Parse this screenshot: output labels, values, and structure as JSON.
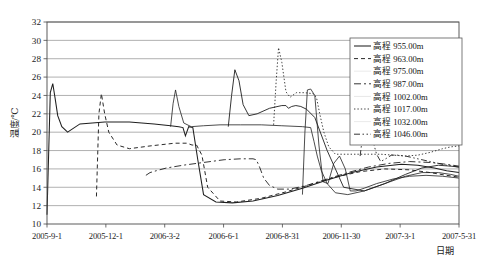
{
  "chart_data": {
    "type": "line",
    "title": "",
    "xlabel": "日期",
    "ylabel": "温度/℃",
    "ylim": [
      10,
      32
    ],
    "ytick_step": 2,
    "yticks": [
      "32",
      "30",
      "28",
      "26",
      "24",
      "22",
      "20",
      "18",
      "16",
      "14",
      "12",
      "10"
    ],
    "xticks": [
      "2005-9-1",
      "2005-12-1",
      "2006-3-2",
      "2006-6-1",
      "2006-8-31",
      "2006-11-30",
      "2007-3-1",
      "2007-5-31"
    ],
    "xlim_labels": [
      "2005-9-1",
      "2007-5-31"
    ],
    "grid": "horizontal",
    "legend_position": "top-right-inside",
    "legend_title": "",
    "line_color": "#1f1f1f",
    "series": [
      {
        "name": "高程 955.00m",
        "label": "高程 955.00m",
        "style": "solid",
        "dash": "none",
        "x": [
          0,
          0.8,
          1.4,
          2.0,
          2.6,
          3.6,
          5.0,
          8.0,
          14.0,
          20.0,
          26.0,
          30.0,
          32.0,
          33.0,
          33.6,
          34.4,
          35.4,
          36.6,
          38.0,
          41.0,
          45.0,
          50.0,
          56.0,
          62.0,
          68.0,
          74.0,
          80.0,
          86.0,
          90.0,
          94.0,
          97.0,
          100.0
        ],
        "y": [
          11.0,
          24.3,
          25.3,
          23.6,
          21.8,
          20.6,
          20.0,
          20.9,
          21.1,
          21.1,
          20.9,
          20.7,
          20.6,
          20.5,
          19.6,
          20.6,
          20.5,
          17.0,
          13.2,
          12.4,
          12.3,
          12.5,
          13.1,
          13.9,
          14.8,
          15.6,
          16.2,
          16.5,
          16.4,
          16.1,
          15.8,
          15.6
        ]
      },
      {
        "name": "高程 963.00m",
        "label": "高程 963.00m",
        "style": "dashed",
        "dash": "4,3",
        "x": [
          12.0,
          12.6,
          13.2,
          14.0,
          15.0,
          17.0,
          20.0,
          25.0,
          31.0,
          34.0,
          35.2,
          36.3,
          37.6,
          39.0,
          42.0,
          46.0,
          52.0,
          58.0,
          64.0,
          70.0,
          76.0,
          82.0,
          88.0,
          93.0,
          97.0,
          100.0
        ],
        "y": [
          13.0,
          22.0,
          24.2,
          22.0,
          20.0,
          18.6,
          18.2,
          18.5,
          18.8,
          18.8,
          18.6,
          18.6,
          17.5,
          14.0,
          12.5,
          12.4,
          12.8,
          13.5,
          14.3,
          15.1,
          15.7,
          16.0,
          15.9,
          15.6,
          15.3,
          15.1
        ]
      },
      {
        "name": "高程 975.00m",
        "label": "高程 975.00m",
        "style": "solid-thin",
        "dash": "none",
        "x": [
          30.0,
          30.6,
          31.2,
          32.0,
          33.2,
          35.0,
          38.0,
          42.0,
          47.0,
          52.0,
          57.0,
          62.0,
          64.0,
          64.8,
          65.6,
          66.6,
          68.0,
          70.0,
          73.0,
          77.0,
          82.0,
          87.0,
          91.0,
          95.0,
          98.0,
          100.0
        ],
        "y": [
          20.6,
          23.1,
          24.6,
          22.8,
          21.0,
          20.6,
          20.7,
          20.8,
          20.8,
          20.8,
          20.7,
          20.6,
          20.5,
          19.0,
          17.4,
          15.8,
          14.4,
          13.4,
          13.2,
          13.6,
          14.4,
          15.2,
          15.6,
          15.6,
          15.4,
          15.2
        ]
      },
      {
        "name": "高程 987.00m",
        "label": "高程 987.00m",
        "style": "dashdot",
        "dash": "7,3,2,3",
        "x": [
          24.0,
          25.0,
          26.5,
          29.0,
          33.0,
          38.0,
          43.0,
          47.0,
          50.0,
          50.8,
          51.6,
          52.6,
          54.0,
          56.0,
          59.0,
          63.0,
          68.0,
          73.0,
          78.0,
          83.0,
          88.0,
          93.0,
          97.0,
          100.0
        ],
        "y": [
          15.3,
          15.6,
          15.8,
          16.1,
          16.4,
          16.7,
          17.0,
          17.1,
          17.1,
          17.0,
          16.2,
          15.0,
          14.2,
          13.8,
          13.8,
          14.2,
          14.9,
          15.6,
          16.2,
          16.6,
          16.8,
          16.7,
          16.5,
          16.3
        ]
      },
      {
        "name": "高程 1002.00m",
        "label": "高程 1002.00m",
        "style": "solid-thin2",
        "dash": "none",
        "x": [
          44.0,
          44.8,
          45.6,
          46.6,
          47.6,
          49.0,
          51.0,
          54.0,
          57.0,
          58.0,
          58.6,
          59.4,
          60.4,
          61.6,
          63.0,
          65.0,
          68.0,
          72.0,
          77.0,
          82.0,
          87.0,
          91.0,
          95.0,
          98.0,
          100.0
        ],
        "y": [
          20.6,
          24.0,
          26.8,
          25.6,
          23.0,
          21.8,
          22.0,
          22.6,
          22.9,
          22.9,
          22.6,
          22.8,
          22.9,
          22.8,
          22.5,
          21.6,
          18.0,
          14.0,
          13.6,
          14.4,
          15.4,
          16.1,
          16.4,
          16.3,
          16.2
        ]
      },
      {
        "name": "高程 1017.00m",
        "label": "高程 1017.00m",
        "style": "dotted",
        "dash": "1.4,2.0",
        "x": [
          55.0,
          55.6,
          56.2,
          57.0,
          58.0,
          59.0,
          60.5,
          62.5,
          64.5,
          65.4,
          66.2,
          67.2,
          68.4,
          70.0,
          72.0,
          75.0,
          78.0,
          81.0,
          84.0,
          87.0,
          90.0,
          93.0,
          96.0,
          98.0,
          100.0
        ],
        "y": [
          20.8,
          25.4,
          29.2,
          27.6,
          24.4,
          23.8,
          24.3,
          24.3,
          24.2,
          23.8,
          22.0,
          20.0,
          18.4,
          17.6,
          17.6,
          17.6,
          17.6,
          17.6,
          17.5,
          17.4,
          17.5,
          17.8,
          18.2,
          18.4,
          18.5
        ]
      },
      {
        "name": "高程 1032.00m",
        "label": "高程 1032.00m",
        "style": "solid-thin3",
        "dash": "none",
        "x": [
          62.0,
          62.6,
          63.2,
          64.0,
          65.0,
          66.0,
          67.0,
          68.2,
          69.6,
          71.0,
          72.4,
          73.6,
          75.0,
          77.0,
          80.0,
          84.0,
          88.0,
          92.0,
          96.0,
          100.0
        ],
        "y": [
          13.2,
          20.0,
          24.6,
          24.7,
          24.0,
          18.6,
          14.6,
          14.4,
          16.6,
          17.4,
          16.0,
          13.6,
          13.6,
          13.9,
          14.4,
          14.9,
          15.2,
          15.3,
          15.2,
          15.0
        ]
      },
      {
        "name": "高程 1046.00m",
        "label": "高程 1046.00m",
        "style": "dashdotdot",
        "dash": "6,2.5,1.5,2.5,1.5,2.5",
        "x": [
          76.0,
          76.6,
          77.2,
          78.0,
          79.0,
          80.0,
          81.0,
          82.2,
          83.6,
          85.0,
          87.0,
          89.0,
          91.0,
          93.0,
          95.0,
          97.0,
          98.5,
          100.0
        ],
        "y": [
          17.4,
          19.6,
          21.8,
          21.0,
          19.2,
          17.6,
          16.8,
          17.1,
          17.5,
          17.5,
          17.4,
          17.2,
          17.0,
          16.8,
          16.6,
          16.4,
          16.3,
          16.2
        ]
      }
    ]
  }
}
